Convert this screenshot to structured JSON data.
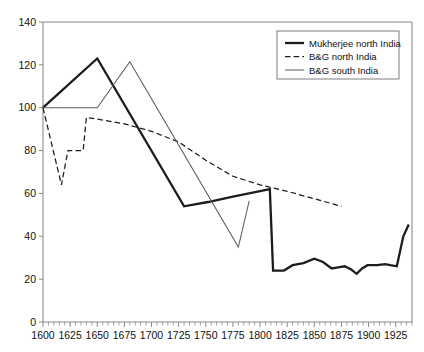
{
  "chart_data": {
    "type": "line",
    "title": "",
    "subtitle": "",
    "xlabel": "",
    "ylabel": "",
    "xlim": [
      1600,
      1940
    ],
    "ylim": [
      0,
      140
    ],
    "grid": false,
    "legend_position": "top-right",
    "y_ticks": [
      0,
      20,
      40,
      60,
      80,
      100,
      120,
      140
    ],
    "y_tick_labels": [
      "0",
      "20",
      "40",
      "60",
      "80",
      "100",
      "120",
      "140"
    ],
    "x_ticks": [
      1600,
      1625,
      1650,
      1675,
      1700,
      1725,
      1750,
      1775,
      1800,
      1825,
      1850,
      1875,
      1900,
      1925
    ],
    "x_tick_labels": [
      "1600",
      "1625",
      "1650",
      "1675",
      "1700",
      "1725",
      "1750",
      "1775",
      "1800",
      "1825",
      "1850",
      "1875",
      "1900",
      "1925"
    ],
    "x_minor_tick_step": 5,
    "series": [
      {
        "name": "Mukherjee north India",
        "style": "solid-thick",
        "color": "#1c1c1c",
        "points": [
          [
            1600,
            100
          ],
          [
            1650,
            123
          ],
          [
            1730,
            54
          ],
          [
            1752,
            56
          ],
          [
            1775,
            58.5
          ],
          [
            1809,
            62
          ],
          [
            1812,
            24
          ],
          [
            1822,
            24
          ],
          [
            1830,
            26.5
          ],
          [
            1840,
            27.5
          ],
          [
            1850,
            29.5
          ],
          [
            1858,
            28
          ],
          [
            1866,
            25
          ],
          [
            1872,
            25.5
          ],
          [
            1878,
            26
          ],
          [
            1884,
            24.5
          ],
          [
            1889,
            22.5
          ],
          [
            1894,
            25
          ],
          [
            1899,
            26.5
          ],
          [
            1908,
            26.5
          ],
          [
            1915,
            27
          ],
          [
            1920,
            26.5
          ],
          [
            1926,
            26
          ],
          [
            1932,
            40
          ],
          [
            1937,
            45.5
          ]
        ]
      },
      {
        "name": "B&G north India",
        "style": "dashed",
        "color": "#1c1c1c",
        "points": [
          [
            1600,
            100
          ],
          [
            1617,
            64
          ],
          [
            1623,
            80
          ],
          [
            1637,
            80
          ],
          [
            1640,
            95.5
          ],
          [
            1675,
            92.5
          ],
          [
            1700,
            89
          ],
          [
            1725,
            84
          ],
          [
            1750,
            75.5
          ],
          [
            1775,
            68
          ],
          [
            1800,
            64
          ],
          [
            1825,
            61
          ],
          [
            1850,
            57.5
          ],
          [
            1875,
            54
          ]
        ]
      },
      {
        "name": "B&G south India",
        "style": "solid-thin",
        "color": "#5e5e5e",
        "points": [
          [
            1600,
            100
          ],
          [
            1650,
            100
          ],
          [
            1680,
            121.5
          ],
          [
            1780,
            35
          ],
          [
            1790,
            56.5
          ]
        ]
      }
    ]
  },
  "legend": {
    "entries": [
      {
        "label": "Mukherjee north India",
        "style": "solid-thick"
      },
      {
        "label": "B&G north India",
        "style": "dashed"
      },
      {
        "label": "B&G south India",
        "style": "solid-thin"
      }
    ]
  },
  "colors": {
    "axis": "#8a8a8a",
    "thick_series": "#1c1c1c",
    "dashed_series": "#1c1c1c",
    "thin_series": "#5e5e5e",
    "legend_border": "#6f6f6f",
    "background": "#ffffff"
  }
}
